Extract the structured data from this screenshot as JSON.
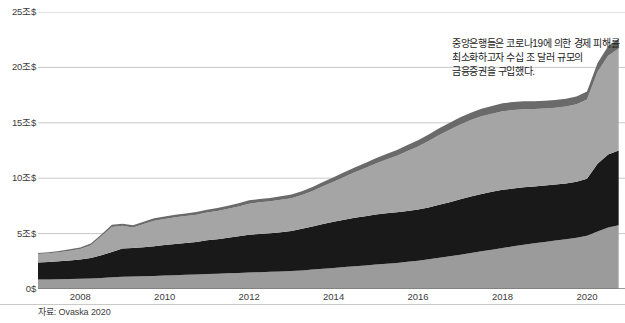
{
  "source_note": "자료: Ovaska 2020",
  "annotation": "중앙은행들은 코로나19에 의한 경제 피해를 최소화하고자 수십 조 달러 규모의 금융증권을 구입했다.",
  "colors": {
    "layer_bottom": "#9b9b9b",
    "layer_black": "#191919",
    "layer_mid": "#a5a5a5",
    "layer_thin_dark": "#6a6a6a",
    "gridline": "#c8c8c8",
    "baseline": "#7a7a7a",
    "text": "#3c3c3c",
    "background": "#ffffff"
  },
  "chart_data": {
    "type": "area",
    "title": "",
    "subtitle": "",
    "xlabel": "",
    "ylabel": "",
    "stacked": true,
    "grid": true,
    "legend_position": "none",
    "xlim": [
      2007.0,
      2020.9
    ],
    "ylim": [
      0,
      25
    ],
    "ytick_labels": [
      "0$",
      "5조$",
      "10조$",
      "15조$",
      "20조$",
      "25조$"
    ],
    "ytick_values": [
      0,
      5,
      10,
      15,
      20,
      25
    ],
    "xtick_labels": [
      "2008",
      "2010",
      "2012",
      "2014",
      "2016",
      "2018",
      "2020"
    ],
    "xtick_values": [
      2008,
      2010,
      2012,
      2014,
      2016,
      2018,
      2020
    ],
    "units": "조 달러 (trillion USD)",
    "x": [
      2007.0,
      2007.25,
      2007.5,
      2007.75,
      2008.0,
      2008.25,
      2008.5,
      2008.75,
      2009.0,
      2009.25,
      2009.5,
      2009.75,
      2010.0,
      2010.25,
      2010.5,
      2010.75,
      2011.0,
      2011.25,
      2011.5,
      2011.75,
      2012.0,
      2012.25,
      2012.5,
      2012.75,
      2013.0,
      2013.25,
      2013.5,
      2013.75,
      2014.0,
      2014.25,
      2014.5,
      2014.75,
      2015.0,
      2015.25,
      2015.5,
      2015.75,
      2016.0,
      2016.25,
      2016.5,
      2016.75,
      2017.0,
      2017.25,
      2017.5,
      2017.75,
      2018.0,
      2018.25,
      2018.5,
      2018.75,
      2019.0,
      2019.25,
      2019.5,
      2019.75,
      2020.0,
      2020.25,
      2020.5,
      2020.75
    ],
    "series": [
      {
        "name": "layer-1-bottom",
        "color": "#9b9b9b",
        "values": [
          0.85,
          0.86,
          0.88,
          0.9,
          0.92,
          0.95,
          1.0,
          1.05,
          1.1,
          1.12,
          1.15,
          1.18,
          1.22,
          1.25,
          1.28,
          1.3,
          1.35,
          1.38,
          1.42,
          1.45,
          1.5,
          1.52,
          1.55,
          1.58,
          1.62,
          1.68,
          1.75,
          1.82,
          1.9,
          1.98,
          2.05,
          2.12,
          2.2,
          2.28,
          2.35,
          2.45,
          2.55,
          2.68,
          2.82,
          2.95,
          3.1,
          3.25,
          3.4,
          3.55,
          3.7,
          3.85,
          4.0,
          4.12,
          4.25,
          4.38,
          4.5,
          4.62,
          4.8,
          5.2,
          5.55,
          5.75
        ]
      },
      {
        "name": "layer-2-black",
        "color": "#191919",
        "values": [
          1.55,
          1.58,
          1.62,
          1.68,
          1.75,
          1.85,
          2.05,
          2.3,
          2.55,
          2.58,
          2.62,
          2.68,
          2.75,
          2.82,
          2.88,
          2.95,
          3.05,
          3.12,
          3.2,
          3.3,
          3.4,
          3.45,
          3.48,
          3.55,
          3.62,
          3.75,
          3.9,
          4.05,
          4.18,
          4.28,
          4.38,
          4.45,
          4.52,
          4.55,
          4.58,
          4.6,
          4.62,
          4.68,
          4.78,
          4.88,
          5.0,
          5.1,
          5.18,
          5.22,
          5.25,
          5.22,
          5.18,
          5.12,
          5.08,
          5.05,
          5.02,
          5.05,
          5.15,
          6.1,
          6.6,
          6.75
        ]
      },
      {
        "name": "layer-3-mid",
        "color": "#a5a5a5",
        "values": [
          0.75,
          0.78,
          0.82,
          0.88,
          0.95,
          1.15,
          1.7,
          2.25,
          2.05,
          1.85,
          2.1,
          2.3,
          2.35,
          2.4,
          2.42,
          2.45,
          2.5,
          2.55,
          2.62,
          2.7,
          2.8,
          2.85,
          2.88,
          2.92,
          2.95,
          3.05,
          3.2,
          3.4,
          3.6,
          3.85,
          4.1,
          4.35,
          4.6,
          4.85,
          5.1,
          5.4,
          5.7,
          6.0,
          6.3,
          6.55,
          6.75,
          6.9,
          7.0,
          7.05,
          7.1,
          7.08,
          7.05,
          7.0,
          6.95,
          6.92,
          6.95,
          7.0,
          7.15,
          8.3,
          8.9,
          9.2
        ]
      },
      {
        "name": "layer-4-thin-dark",
        "color": "#6a6a6a",
        "values": [
          0.1,
          0.1,
          0.11,
          0.12,
          0.13,
          0.15,
          0.18,
          0.2,
          0.2,
          0.2,
          0.21,
          0.22,
          0.22,
          0.23,
          0.24,
          0.25,
          0.25,
          0.26,
          0.27,
          0.28,
          0.3,
          0.3,
          0.31,
          0.32,
          0.33,
          0.34,
          0.36,
          0.38,
          0.4,
          0.42,
          0.44,
          0.46,
          0.48,
          0.5,
          0.52,
          0.54,
          0.56,
          0.58,
          0.6,
          0.62,
          0.64,
          0.66,
          0.68,
          0.7,
          0.72,
          0.72,
          0.72,
          0.71,
          0.7,
          0.7,
          0.7,
          0.71,
          0.73,
          0.8,
          0.85,
          0.88
        ]
      }
    ]
  }
}
